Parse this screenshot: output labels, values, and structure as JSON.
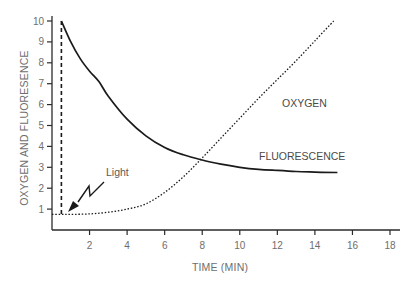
{
  "chart_data": {
    "type": "line",
    "title": "",
    "xlabel": "TIME (MIN)",
    "ylabel": "OXYGEN AND FLUORESENCE",
    "xlim": [
      0,
      18
    ],
    "ylim": [
      0,
      10
    ],
    "xticks": [
      2,
      4,
      6,
      8,
      10,
      12,
      14,
      16,
      18
    ],
    "yticks": [
      1,
      2,
      3,
      4,
      5,
      6,
      7,
      8,
      9,
      10
    ],
    "grid": false,
    "legend": "inline labels",
    "series": [
      {
        "name": "FLUORESCENCE",
        "style": "solid",
        "x": [
          0.5,
          1,
          1.5,
          2,
          2.5,
          3,
          4,
          5,
          6,
          7,
          8,
          9,
          10,
          11,
          12,
          13,
          14,
          15.2
        ],
        "y": [
          10,
          9.0,
          8.2,
          7.6,
          7.1,
          6.4,
          5.3,
          4.5,
          3.95,
          3.6,
          3.35,
          3.15,
          3.0,
          2.9,
          2.85,
          2.8,
          2.77,
          2.75
        ]
      },
      {
        "name": "OXYGEN",
        "style": "dotted",
        "x": [
          0,
          0.5,
          1,
          2,
          3,
          4,
          5,
          6,
          7,
          8,
          9,
          10,
          11,
          12,
          13,
          14,
          15
        ],
        "y": [
          0.75,
          0.75,
          0.75,
          0.77,
          0.85,
          1.0,
          1.25,
          1.8,
          2.55,
          3.45,
          4.4,
          5.35,
          6.3,
          7.2,
          8.1,
          9.05,
          10
        ]
      }
    ],
    "annotations": [
      {
        "text": "Light",
        "type": "zigzag-arrow",
        "target": [
          0.5,
          0.75
        ]
      },
      {
        "type": "vertical-dashed-line",
        "x": 0.5,
        "y_range": [
          0.75,
          10
        ]
      }
    ]
  },
  "labels": {
    "x_axis_title": "TIME (MIN)",
    "y_axis_title": "OXYGEN AND FLUORESENCE",
    "oxygen": "OXYGEN",
    "fluorescence": "FLUORESCENCE",
    "light": "Light"
  },
  "x_tick_labels": [
    "2",
    "4",
    "6",
    "8",
    "10",
    "12",
    "14",
    "16",
    "18"
  ],
  "y_tick_labels": [
    "1",
    "2",
    "3",
    "4",
    "5",
    "6",
    "7",
    "8",
    "9",
    "10"
  ]
}
